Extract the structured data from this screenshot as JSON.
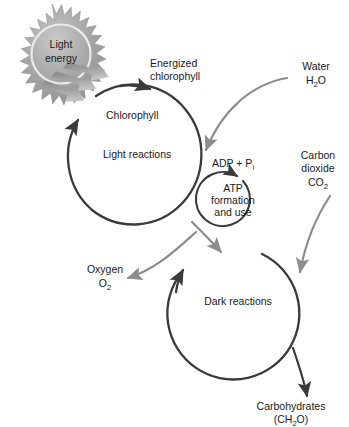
{
  "diagram": {
    "colors": {
      "dark_stroke": "#3a3a3a",
      "grey_stroke": "#8c8c8c",
      "sun_fill": "#9a9a9a",
      "sun_inner": "#b5b5b5",
      "text": "#1a1a1a",
      "background": "#ffffff"
    }
  },
  "labels": {
    "light_energy_line1": "Light",
    "light_energy_line2": "energy",
    "energized_chlorophyll_line1": "Energized",
    "energized_chlorophyll_line2": "chlorophyll",
    "chlorophyll": "Chlorophyll",
    "light_reactions": "Light reactions",
    "dark_reactions": "Dark reactions",
    "adp_pi_main": "ADP + P",
    "adp_pi_sub": "i",
    "atp_line1": "ATP",
    "atp_line2": "formation",
    "atp_line3": "and use",
    "water_name": "Water",
    "water_formula_pre": "H",
    "water_formula_sub": "2",
    "water_formula_post": "O",
    "carbon_dioxide_line1": "Carbon",
    "carbon_dioxide_line2": "dioxide",
    "carbon_dioxide_formula_pre": "CO",
    "carbon_dioxide_formula_sub": "2",
    "oxygen_name": "Oxygen",
    "oxygen_formula_pre": "O",
    "oxygen_formula_sub": "2",
    "carbohydrates_name": "Carbohydrates",
    "carbohydrates_formula_pre": "(CH",
    "carbohydrates_formula_sub": "2",
    "carbohydrates_formula_post": "O)"
  },
  "icons": {
    "sun": "sun-starburst-icon",
    "ray": "light-ray-arrow-icon"
  }
}
